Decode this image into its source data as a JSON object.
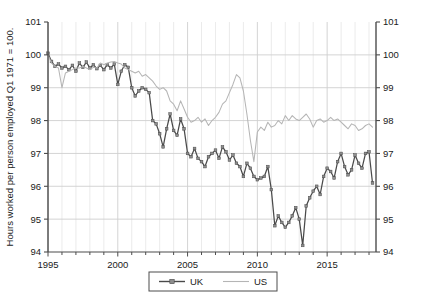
{
  "chart_data": {
    "type": "line",
    "title": "",
    "xlabel": "",
    "ylabel": "Hours worked per person employed Q1 1971 = 100.",
    "xlim": [
      1995,
      2018.5
    ],
    "ylim": [
      94,
      101
    ],
    "grid": true,
    "legend_position": "bottom-center",
    "xticks": [
      1995,
      2000,
      2005,
      2010,
      2015
    ],
    "xtick_labels": [
      "1995",
      "2000",
      "2005",
      "2010",
      "2015"
    ],
    "yticks": [
      94,
      95,
      96,
      97,
      98,
      99,
      100,
      101
    ],
    "ytick_labels": [
      "94",
      "95",
      "96",
      "97",
      "98",
      "99",
      "100",
      "101"
    ],
    "yticks_right": [
      94,
      95,
      96,
      97,
      98,
      99,
      100,
      101
    ],
    "ytick_labels_right": [
      "94",
      "95",
      "96",
      "97",
      "98",
      "99",
      "100",
      "101"
    ],
    "x_minor_gridlines_every": 1,
    "series": [
      {
        "name": "UK",
        "color": "#4a4a4a",
        "marker": "square",
        "x": [
          1995.0,
          1995.25,
          1995.5,
          1995.75,
          1996.0,
          1996.25,
          1996.5,
          1996.75,
          1997.0,
          1997.25,
          1997.5,
          1997.75,
          1998.0,
          1998.25,
          1998.5,
          1998.75,
          1999.0,
          1999.25,
          1999.5,
          1999.75,
          2000.0,
          2000.25,
          2000.5,
          2000.75,
          2001.0,
          2001.25,
          2001.5,
          2001.75,
          2002.0,
          2002.25,
          2002.5,
          2002.75,
          2003.0,
          2003.25,
          2003.5,
          2003.75,
          2004.0,
          2004.25,
          2004.5,
          2004.75,
          2005.0,
          2005.25,
          2005.5,
          2005.75,
          2006.0,
          2006.25,
          2006.5,
          2006.75,
          2007.0,
          2007.25,
          2007.5,
          2007.75,
          2008.0,
          2008.25,
          2008.5,
          2008.75,
          2009.0,
          2009.25,
          2009.5,
          2009.75,
          2010.0,
          2010.25,
          2010.5,
          2010.75,
          2011.0,
          2011.25,
          2011.5,
          2011.75,
          2012.0,
          2012.25,
          2012.5,
          2012.75,
          2013.0,
          2013.25,
          2013.5,
          2013.75,
          2014.0,
          2014.25,
          2014.5,
          2014.75,
          2015.0,
          2015.25,
          2015.5,
          2015.75,
          2016.0,
          2016.25,
          2016.5,
          2016.75,
          2017.0,
          2017.25,
          2017.5,
          2017.75,
          2018.0,
          2018.25
        ],
        "y": [
          100.05,
          99.8,
          99.65,
          99.72,
          99.6,
          99.65,
          99.55,
          99.68,
          99.5,
          99.75,
          99.62,
          99.78,
          99.6,
          99.7,
          99.58,
          99.68,
          99.55,
          99.7,
          99.6,
          99.72,
          99.1,
          99.5,
          99.7,
          99.62,
          99.0,
          98.75,
          98.9,
          99.0,
          98.95,
          98.85,
          98.0,
          97.9,
          97.6,
          97.2,
          97.75,
          98.2,
          97.7,
          97.55,
          98.05,
          97.75,
          97.0,
          96.9,
          97.15,
          96.85,
          96.75,
          96.6,
          96.9,
          97.0,
          97.1,
          96.85,
          97.2,
          97.05,
          96.8,
          96.95,
          96.7,
          96.6,
          96.3,
          96.7,
          96.55,
          96.3,
          96.2,
          96.25,
          96.3,
          96.6,
          95.9,
          94.8,
          95.1,
          94.9,
          94.75,
          94.9,
          95.1,
          95.35,
          95.0,
          94.2,
          95.4,
          95.65,
          95.85,
          96.0,
          95.75,
          96.3,
          96.55,
          96.45,
          96.25,
          96.75,
          97.0,
          96.6,
          96.35,
          96.5,
          96.95,
          96.7,
          96.55,
          97.0,
          97.05,
          96.1
        ]
      },
      {
        "name": "US",
        "color": "#b5b5b5",
        "marker": "none",
        "x": [
          1995.0,
          1995.25,
          1995.5,
          1995.75,
          1996.0,
          1996.25,
          1996.5,
          1996.75,
          1997.0,
          1997.25,
          1997.5,
          1997.75,
          1998.0,
          1998.25,
          1998.5,
          1998.75,
          1999.0,
          1999.25,
          1999.5,
          1999.75,
          2000.0,
          2000.25,
          2000.5,
          2000.75,
          2001.0,
          2001.25,
          2001.5,
          2001.75,
          2002.0,
          2002.25,
          2002.5,
          2002.75,
          2003.0,
          2003.25,
          2003.5,
          2003.75,
          2004.0,
          2004.25,
          2004.5,
          2004.75,
          2005.0,
          2005.25,
          2005.5,
          2005.75,
          2006.0,
          2006.25,
          2006.5,
          2006.75,
          2007.0,
          2007.25,
          2007.5,
          2007.75,
          2008.0,
          2008.25,
          2008.5,
          2008.75,
          2009.0,
          2009.25,
          2009.5,
          2009.75,
          2010.0,
          2010.25,
          2010.5,
          2010.75,
          2011.0,
          2011.25,
          2011.5,
          2011.75,
          2012.0,
          2012.25,
          2012.5,
          2012.75,
          2013.0,
          2013.25,
          2013.5,
          2013.75,
          2014.0,
          2014.25,
          2014.5,
          2014.75,
          2015.0,
          2015.25,
          2015.5,
          2015.75,
          2016.0,
          2016.25,
          2016.5,
          2016.75,
          2017.0,
          2017.25,
          2017.5,
          2017.75,
          2018.0,
          2018.25
        ],
        "y": [
          100.0,
          99.75,
          99.65,
          99.6,
          99.0,
          99.45,
          99.5,
          99.55,
          99.6,
          99.6,
          99.65,
          99.6,
          99.55,
          99.62,
          99.6,
          99.75,
          99.7,
          99.75,
          99.78,
          99.8,
          99.75,
          99.72,
          99.6,
          99.55,
          99.5,
          99.45,
          99.5,
          99.35,
          99.4,
          99.3,
          99.2,
          99.05,
          98.95,
          99.0,
          98.9,
          98.6,
          98.5,
          98.3,
          98.6,
          98.35,
          98.1,
          97.95,
          98.0,
          98.1,
          97.95,
          98.05,
          97.85,
          98.0,
          98.1,
          98.25,
          98.5,
          98.6,
          98.85,
          99.1,
          99.4,
          99.3,
          98.9,
          98.2,
          97.4,
          96.75,
          97.65,
          97.8,
          97.7,
          97.95,
          97.8,
          97.85,
          98.0,
          97.9,
          98.15,
          98.0,
          98.15,
          98.05,
          98.0,
          98.1,
          98.2,
          98.05,
          97.8,
          98.0,
          98.05,
          97.95,
          98.0,
          98.1,
          98.0,
          98.05,
          97.95,
          97.85,
          97.75,
          97.9,
          97.85,
          97.7,
          97.75,
          97.85,
          97.9,
          97.8
        ]
      }
    ]
  },
  "legend": {
    "items": [
      {
        "label": "UK",
        "color": "#4a4a4a",
        "marker": "square"
      },
      {
        "label": "US",
        "color": "#b5b5b5",
        "marker": "none"
      }
    ]
  }
}
